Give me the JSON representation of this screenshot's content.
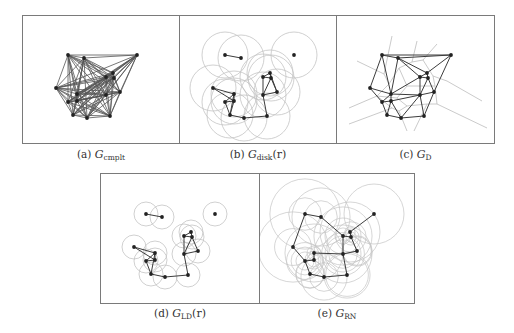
{
  "figure": {
    "nodes": [
      [
        45,
        39
      ],
      [
        61,
        42
      ],
      [
        114,
        39
      ],
      [
        33,
        72
      ],
      [
        83,
        61
      ],
      [
        90,
        57
      ],
      [
        91,
        62
      ],
      [
        97,
        76
      ],
      [
        83,
        79
      ],
      [
        54,
        78
      ],
      [
        54,
        85
      ],
      [
        45,
        86
      ],
      [
        50,
        99
      ],
      [
        64,
        102
      ],
      [
        87,
        100
      ]
    ],
    "panels": [
      {
        "id": "a",
        "label": "(a)",
        "symbol": "G",
        "subscript": "cmplt",
        "argument": "",
        "graph_type": "complete",
        "edges": "all",
        "circles": "none"
      },
      {
        "id": "b",
        "label": "(b)",
        "symbol": "G",
        "subscript": "disk",
        "argument": "(r)",
        "graph_type": "unit-disk",
        "edges": [
          [
            0,
            1
          ],
          [
            3,
            9
          ],
          [
            3,
            10
          ],
          [
            9,
            10
          ],
          [
            9,
            11
          ],
          [
            10,
            11
          ],
          [
            9,
            12
          ],
          [
            10,
            12
          ],
          [
            11,
            12
          ],
          [
            12,
            13
          ],
          [
            13,
            14
          ],
          [
            14,
            8
          ],
          [
            4,
            5
          ],
          [
            4,
            6
          ],
          [
            5,
            6
          ],
          [
            4,
            8
          ],
          [
            6,
            8
          ],
          [
            6,
            7
          ],
          [
            7,
            8
          ],
          [
            5,
            7
          ]
        ],
        "circles": "uniform",
        "radius_units": 23
      },
      {
        "id": "c",
        "label": "(c)",
        "symbol": "G",
        "subscript": "D",
        "argument": "",
        "graph_type": "delaunay",
        "edges": [
          [
            0,
            1
          ],
          [
            0,
            2
          ],
          [
            1,
            2
          ],
          [
            0,
            3
          ],
          [
            0,
            9
          ],
          [
            1,
            9
          ],
          [
            1,
            4
          ],
          [
            1,
            5
          ],
          [
            2,
            5
          ],
          [
            2,
            7
          ],
          [
            5,
            6
          ],
          [
            4,
            5
          ],
          [
            4,
            6
          ],
          [
            6,
            7
          ],
          [
            4,
            9
          ],
          [
            4,
            8
          ],
          [
            6,
            8
          ],
          [
            7,
            8
          ],
          [
            3,
            9
          ],
          [
            3,
            11
          ],
          [
            9,
            11
          ],
          [
            9,
            10
          ],
          [
            10,
            11
          ],
          [
            9,
            8
          ],
          [
            10,
            8
          ],
          [
            11,
            12
          ],
          [
            10,
            12
          ],
          [
            10,
            13
          ],
          [
            12,
            13
          ],
          [
            13,
            8
          ],
          [
            13,
            14
          ],
          [
            8,
            14
          ],
          [
            7,
            14
          ]
        ],
        "voronoi": true
      },
      {
        "id": "d",
        "label": "(d)",
        "symbol": "G",
        "subscript": "LD",
        "argument": "(r)",
        "graph_type": "localized-delaunay",
        "edges": [
          [
            0,
            1
          ],
          [
            3,
            9
          ],
          [
            3,
            10
          ],
          [
            9,
            10
          ],
          [
            9,
            11
          ],
          [
            10,
            11
          ],
          [
            9,
            12
          ],
          [
            11,
            12
          ],
          [
            12,
            13
          ],
          [
            13,
            14
          ],
          [
            14,
            8
          ],
          [
            4,
            5
          ],
          [
            4,
            6
          ],
          [
            5,
            6
          ],
          [
            4,
            8
          ],
          [
            6,
            8
          ],
          [
            6,
            7
          ],
          [
            7,
            8
          ]
        ],
        "circles": "uniform",
        "radius_units": 12
      },
      {
        "id": "e",
        "label": "(e)",
        "symbol": "G",
        "subscript": "RN",
        "argument": "",
        "graph_type": "relative-neighborhood",
        "edges": [
          [
            0,
            1
          ],
          [
            1,
            4
          ],
          [
            2,
            5
          ],
          [
            5,
            6
          ],
          [
            4,
            6
          ],
          [
            4,
            8
          ],
          [
            6,
            7
          ],
          [
            7,
            8
          ],
          [
            8,
            9
          ],
          [
            0,
            3
          ],
          [
            3,
            11
          ],
          [
            9,
            10
          ],
          [
            10,
            11
          ],
          [
            11,
            12
          ],
          [
            12,
            13
          ],
          [
            13,
            14
          ],
          [
            14,
            8
          ]
        ],
        "circles": "per-edge"
      }
    ],
    "colors": {
      "node": "#222222",
      "edge": "#3c3c3c",
      "complete_edge": "#555555",
      "circle": "#c4c4c4",
      "voronoi": "#bdbdbd",
      "frame": "#7a7a7a"
    }
  }
}
